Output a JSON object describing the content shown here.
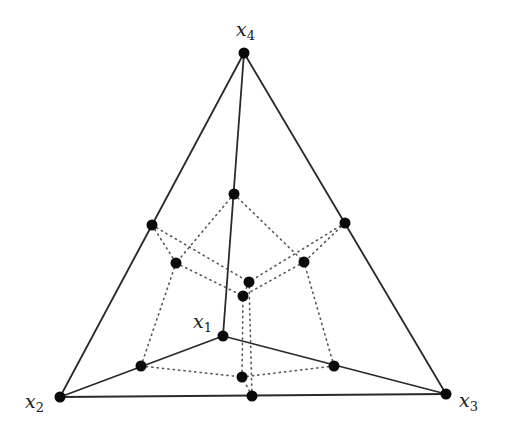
{
  "diagram": {
    "title": "",
    "colors": {
      "line": "#2a2a2a",
      "dotted": "#555555",
      "node": "#0a0a0a",
      "background": "#ffffff"
    },
    "vertices": [
      {
        "id": "x1",
        "base": "x",
        "sub": "1",
        "x": 223,
        "y": 336,
        "label_x": 193,
        "label_y": 312
      },
      {
        "id": "x2",
        "base": "x",
        "sub": "2",
        "x": 60,
        "y": 397,
        "label_x": 25,
        "label_y": 392
      },
      {
        "id": "x3",
        "base": "x",
        "sub": "3",
        "x": 446,
        "y": 394,
        "label_x": 459,
        "label_y": 391
      },
      {
        "id": "x4",
        "base": "x",
        "sub": "4",
        "x": 244,
        "y": 53,
        "label_x": 236,
        "label_y": 20
      }
    ],
    "edges": [
      [
        "x4",
        "x2"
      ],
      [
        "x4",
        "x3"
      ],
      [
        "x2",
        "x3"
      ],
      [
        "x4",
        "x1"
      ],
      [
        "x2",
        "x1"
      ],
      [
        "x1",
        "x3"
      ]
    ],
    "edge_midpoints": [
      {
        "id": "m42",
        "x": 152,
        "y": 225
      },
      {
        "id": "m43",
        "x": 345,
        "y": 223
      },
      {
        "id": "m41",
        "x": 234,
        "y": 194
      },
      {
        "id": "m21",
        "x": 141,
        "y": 366
      },
      {
        "id": "m13",
        "x": 334,
        "y": 366
      },
      {
        "id": "m23",
        "x": 252,
        "y": 396
      }
    ],
    "face_centroids": [
      {
        "id": "f421",
        "x": 176,
        "y": 263
      },
      {
        "id": "f413",
        "x": 304,
        "y": 262
      },
      {
        "id": "f123",
        "x": 242,
        "y": 377
      },
      {
        "id": "f423",
        "x": 249,
        "y": 282
      }
    ],
    "center": {
      "id": "c",
      "x": 243,
      "y": 296
    },
    "dotted_edges": [
      [
        "m42",
        "f421"
      ],
      [
        "m41",
        "f421"
      ],
      [
        "m21",
        "f421"
      ],
      [
        "m43",
        "f413"
      ],
      [
        "m41",
        "f413"
      ],
      [
        "m13",
        "f413"
      ],
      [
        "m21",
        "f123"
      ],
      [
        "m13",
        "f123"
      ],
      [
        "m23",
        "f123"
      ],
      [
        "m42",
        "f423"
      ],
      [
        "m43",
        "f423"
      ],
      [
        "m23",
        "f423"
      ],
      [
        "f421",
        "c"
      ],
      [
        "f413",
        "c"
      ],
      [
        "f123",
        "c"
      ],
      [
        "f423",
        "c"
      ]
    ]
  }
}
